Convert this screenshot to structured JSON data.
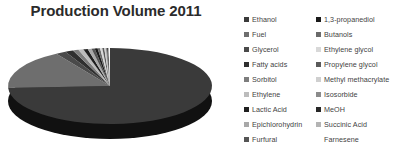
{
  "chart": {
    "title": "Production Volume 2011"
  },
  "legend": {
    "columns": [
      {
        "name": "legend-column-left",
        "items": [
          {
            "label": "Ethanol",
            "color": "#3a3a3a"
          },
          {
            "label": "Fuel",
            "color": "#6e6e6e"
          },
          {
            "label": "Glycerol",
            "color": "#4a4a4a"
          },
          {
            "label": "Fatty acids",
            "color": "#2f2f2f"
          },
          {
            "label": "Sorbitol",
            "color": "#7d7d7d"
          },
          {
            "label": "Ethylene",
            "color": "#bcbcbc"
          },
          {
            "label": "Lactic Acid",
            "color": "#1f1f1f"
          },
          {
            "label": "Epichlorohydrin",
            "color": "#a8a8a8"
          },
          {
            "label": "Furfural",
            "color": "#555555"
          }
        ]
      },
      {
        "name": "legend-column-right",
        "items": [
          {
            "label": "1,3-propanediol",
            "color": "#1a1a1a"
          },
          {
            "label": "Butanols",
            "color": "#6a6a6a"
          },
          {
            "label": "Ethylene glycol",
            "color": "#d8d8d8"
          },
          {
            "label": "Propylene glycol",
            "color": "#5a5a5a"
          },
          {
            "label": "Methyl methacrylate",
            "color": "#cfcfcf"
          },
          {
            "label": "Isosorbide",
            "color": "#8b8b8b"
          },
          {
            "label": "MeOH",
            "color": "#272727"
          },
          {
            "label": "Succinic Acid",
            "color": "#b4b4b4"
          },
          {
            "label": "Farnesene",
            "color": "#ffffff"
          }
        ]
      }
    ]
  },
  "chart_data": {
    "type": "pie",
    "title": "Production Volume 2011",
    "xlabel": "",
    "ylabel": "",
    "three_d": true,
    "legend_position": "right",
    "grid": false,
    "labels": [
      "Ethanol",
      "Fuel",
      "Glycerol",
      "Fatty acids",
      "Sorbitol",
      "Ethylene",
      "Lactic Acid",
      "Epichlorohydrin",
      "Furfural",
      "1,3-propanediol",
      "Butanols",
      "Ethylene glycol",
      "Propylene glycol",
      "Methyl methacrylate",
      "Isosorbide",
      "MeOH",
      "Succinic Acid",
      "Farnesene"
    ],
    "values": [
      74.0,
      17.0,
      1.6,
      1.3,
      0.9,
      0.8,
      0.7,
      0.6,
      0.5,
      0.45,
      0.4,
      0.35,
      0.3,
      0.25,
      0.2,
      0.18,
      0.15,
      0.12
    ],
    "colors": [
      "#3a3a3a",
      "#6e6e6e",
      "#4a4a4a",
      "#2f2f2f",
      "#7d7d7d",
      "#bcbcbc",
      "#1f1f1f",
      "#a8a8a8",
      "#555555",
      "#1a1a1a",
      "#6a6a6a",
      "#d8d8d8",
      "#5a5a5a",
      "#cfcfcf",
      "#8b8b8b",
      "#272727",
      "#b4b4b4",
      "#ffffff"
    ]
  }
}
